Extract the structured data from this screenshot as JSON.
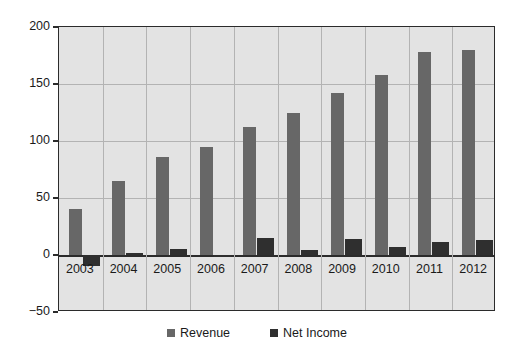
{
  "chart_data": {
    "type": "bar",
    "title": "",
    "subtitle": "",
    "xlabel": "",
    "ylabel": "",
    "categories": [
      "2003",
      "2004",
      "2005",
      "2006",
      "2007",
      "2008",
      "2009",
      "2010",
      "2011",
      "2012"
    ],
    "series": [
      {
        "name": "Revenue",
        "color": "#676767",
        "values": [
          40,
          65,
          86,
          95,
          112,
          125,
          142,
          158,
          178,
          180
        ]
      },
      {
        "name": "Net Income",
        "color": "#2f2f2f",
        "values": [
          -10,
          2,
          5,
          -1,
          15,
          4,
          14,
          7,
          11,
          13
        ]
      }
    ],
    "ylim": [
      -50,
      200
    ],
    "yticks": [
      200,
      150,
      100,
      50,
      0,
      -50
    ],
    "ytick_labels": [
      "200",
      "150",
      "100",
      "50",
      "0",
      "−50"
    ],
    "grid": true,
    "legend_position": "bottom",
    "legend_entries": [
      "Revenue",
      "Net Income"
    ],
    "plot_background": "#e3e3e3",
    "page_background": "#ffffff",
    "axis_color": "#2b2b2b",
    "gridline_color": "#b3b3b3"
  }
}
